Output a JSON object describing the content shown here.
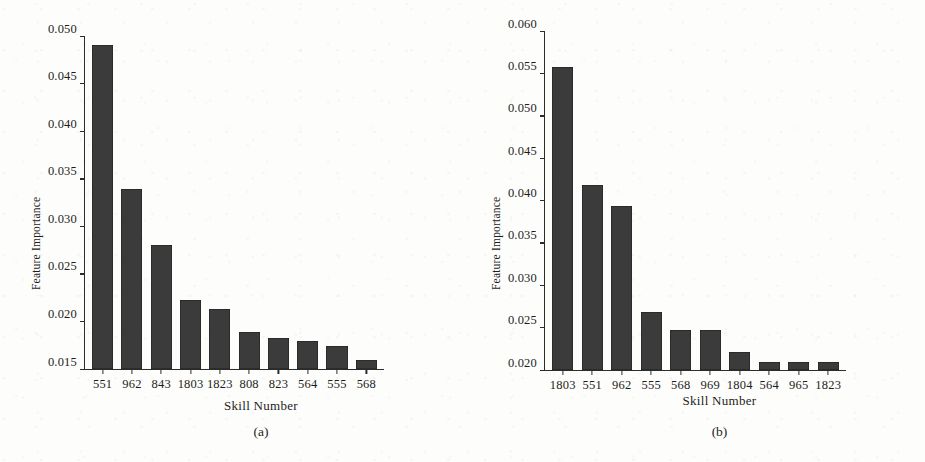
{
  "figure": {
    "panels": [
      {
        "caption": "(a)",
        "xlabel": "Skill Number",
        "ylabel": "Feature Importance"
      },
      {
        "caption": "(b)",
        "xlabel": "Skill Number",
        "ylabel": "Feature Importance"
      }
    ]
  },
  "chart_data": [
    {
      "type": "bar",
      "title": "(a)",
      "xlabel": "Skill Number",
      "ylabel": "Feature Importance",
      "categories": [
        "551",
        "962",
        "843",
        "1803",
        "1823",
        "808",
        "823",
        "564",
        "555",
        "568"
      ],
      "values": [
        0.0491,
        0.0339,
        0.028,
        0.0223,
        0.0213,
        0.0189,
        0.0183,
        0.0179,
        0.0174,
        0.016
      ],
      "ylim": [
        0.015,
        0.05
      ],
      "yticks": [
        "0.015",
        "0.020",
        "0.025",
        "0.030",
        "0.035",
        "0.040",
        "0.045",
        "0.050"
      ],
      "ytick_values": [
        0.015,
        0.02,
        0.025,
        0.03,
        0.035,
        0.04,
        0.045,
        0.05
      ],
      "grid": false,
      "legend": "none",
      "bar_color": "#3b3b3b"
    },
    {
      "type": "bar",
      "title": "(b)",
      "xlabel": "Skill Number",
      "ylabel": "Feature Importance",
      "categories": [
        "1803",
        "551",
        "962",
        "555",
        "568",
        "969",
        "1804",
        "564",
        "965",
        "1823"
      ],
      "values": [
        0.0558,
        0.0418,
        0.0394,
        0.0268,
        0.0247,
        0.0247,
        0.0221,
        0.0209,
        0.0209,
        0.0209
      ],
      "ylim": [
        0.02,
        0.06
      ],
      "yticks": [
        "0.020",
        "0.025",
        "0.030",
        "0.035",
        "0.040",
        "0.045",
        "0.050",
        "0.055",
        "0.060"
      ],
      "ytick_values": [
        0.02,
        0.025,
        0.03,
        0.035,
        0.04,
        0.045,
        0.05,
        0.055,
        0.06
      ],
      "grid": false,
      "legend": "none",
      "bar_color": "#3b3b3b"
    }
  ]
}
